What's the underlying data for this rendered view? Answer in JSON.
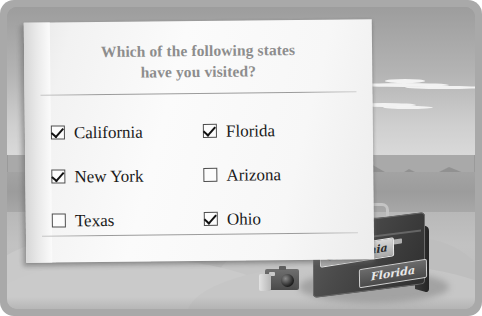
{
  "survey": {
    "title_line1": "Which of the following states",
    "title_line2": "have you visited?",
    "options": [
      {
        "label": "California",
        "checked": true,
        "name": "checkbox-california"
      },
      {
        "label": "Florida",
        "checked": true,
        "name": "checkbox-florida"
      },
      {
        "label": "New York",
        "checked": true,
        "name": "checkbox-new-york"
      },
      {
        "label": "Arizona",
        "checked": false,
        "name": "checkbox-arizona"
      },
      {
        "label": "Texas",
        "checked": false,
        "name": "checkbox-texas"
      },
      {
        "label": "Ohio",
        "checked": true,
        "name": "checkbox-ohio"
      }
    ]
  },
  "illustration": {
    "suitcase_stickers": [
      {
        "label": "California"
      },
      {
        "label": "Florida"
      }
    ]
  },
  "colors": {
    "title_text": "#8d8d8d",
    "option_text": "#1b1b1b",
    "card_paper": "#fbfbfb",
    "frame": "#a9a9a9",
    "sky": "#b4b4b4",
    "sand": "#c2c2c2",
    "suitcase": "#3b3b3b"
  }
}
